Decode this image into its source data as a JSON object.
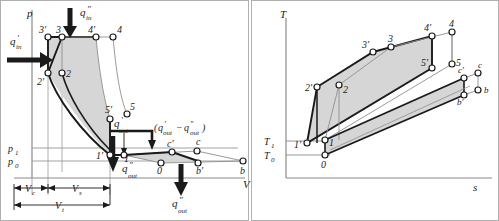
{
  "figure": {
    "type": "thermodynamic-cycle-diagrams",
    "panels": [
      "pV-diagram",
      "Ts-diagram"
    ]
  },
  "pv": {
    "axis": {
      "y_label": "p",
      "x_label": "V"
    },
    "pressure_ticks": [
      {
        "name": "p1",
        "base": "p",
        "sub": "1",
        "y": 148
      },
      {
        "name": "p0",
        "base": "p",
        "sub": "0",
        "y": 161
      }
    ],
    "heat_labels": {
      "q_in_single": {
        "base": "q",
        "prime": "′",
        "sub": "in"
      },
      "q_in_double": {
        "base": "q",
        "prime": "″",
        "sub": "in"
      },
      "q_out_single": {
        "base": "q",
        "prime": "′",
        "sub": "out"
      },
      "q_out_double": {
        "base": "q",
        "prime": "″",
        "sub": "out"
      },
      "q_out_bottom": {
        "base": "q",
        "prime": "″",
        "sub": "out"
      },
      "q_difference": "(q′out−q″out)"
    },
    "volume_dimensions": [
      {
        "base": "V",
        "sub": "c"
      },
      {
        "base": "V",
        "sub": "s"
      },
      {
        "base": "V",
        "sub": "t"
      }
    ],
    "state_points": [
      {
        "label": "3′",
        "x": 48,
        "y": 37
      },
      {
        "label": "3",
        "x": 62,
        "y": 37
      },
      {
        "label": "4′",
        "x": 96,
        "y": 37
      },
      {
        "label": "4",
        "x": 113,
        "y": 37
      },
      {
        "label": "2′",
        "x": 48,
        "y": 73
      },
      {
        "label": "2",
        "x": 62,
        "y": 73
      },
      {
        "label": "5′",
        "x": 110,
        "y": 119
      },
      {
        "label": "5",
        "x": 127,
        "y": 114
      },
      {
        "label": "1′",
        "x": 110,
        "y": 155
      },
      {
        "label": "1",
        "x": 124,
        "y": 155
      },
      {
        "label": "c′",
        "x": 172,
        "y": 152
      },
      {
        "label": "c",
        "x": 197,
        "y": 151
      },
      {
        "label": "0",
        "x": 161,
        "y": 163
      },
      {
        "label": "b′",
        "x": 198,
        "y": 163
      },
      {
        "label": "b",
        "x": 243,
        "y": 161
      }
    ]
  },
  "ts": {
    "axis": {
      "y_label": "T",
      "x_label": "s"
    },
    "temperature_ticks": [
      {
        "base": "T",
        "sub": "1",
        "y": 141
      },
      {
        "base": "T",
        "sub": "0",
        "y": 155
      }
    ],
    "state_points": [
      {
        "label": "2′",
        "x": 317,
        "y": 87
      },
      {
        "label": "2",
        "x": 339,
        "y": 85
      },
      {
        "label": "3′",
        "x": 373,
        "y": 52
      },
      {
        "label": "3",
        "x": 391,
        "y": 47
      },
      {
        "label": "4′",
        "x": 432,
        "y": 36
      },
      {
        "label": "4",
        "x": 452,
        "y": 32
      },
      {
        "label": "5′",
        "x": 432,
        "y": 68
      },
      {
        "label": "5",
        "x": 452,
        "y": 64
      },
      {
        "label": "c′",
        "x": 464,
        "y": 78
      },
      {
        "label": "c",
        "x": 478,
        "y": 73
      },
      {
        "label": "b′",
        "x": 464,
        "y": 95
      },
      {
        "label": "b",
        "x": 478,
        "y": 90
      },
      {
        "label": "1′",
        "x": 307,
        "y": 143
      },
      {
        "label": "1",
        "x": 325,
        "y": 140
      },
      {
        "label": "0",
        "x": 325,
        "y": 155
      }
    ]
  },
  "colors": {
    "line": "#1a1a1a",
    "thin_line": "#808080",
    "fill": "#d6d6d6",
    "axis": "#8a8a8a",
    "background": "#ffffff",
    "border": "#b0b0b0"
  }
}
